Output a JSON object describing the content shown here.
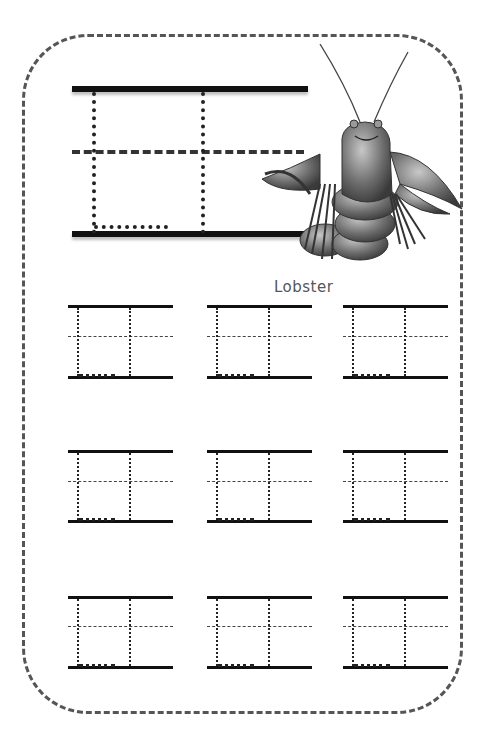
{
  "worksheet": {
    "letter": "H",
    "caption": "Lobster",
    "illustration": "lobster-illustration",
    "colors": {
      "ink": "#111111",
      "border": "#555555",
      "caption": "#555555"
    },
    "practice_grid": {
      "rows": 3,
      "columns": 3
    }
  }
}
